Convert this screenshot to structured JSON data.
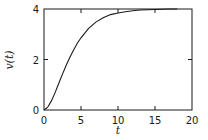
{
  "chart_data": {
    "type": "line",
    "title": "",
    "xlabel": "t",
    "ylabel": "v(t)",
    "xlim": [
      0,
      20
    ],
    "ylim": [
      0,
      4
    ],
    "xticks": [
      0,
      5,
      10,
      15,
      20
    ],
    "yticks": [
      0,
      2,
      4
    ],
    "xtick_labels": [
      "0",
      "5",
      "10",
      "15",
      "20"
    ],
    "ytick_labels": [
      "0",
      "2",
      "4"
    ],
    "grid": false,
    "legend": null,
    "series": [
      {
        "name": "v(t)",
        "x": [
          0,
          0.5,
          1,
          1.5,
          2,
          2.5,
          3,
          3.5,
          4,
          4.5,
          5,
          6,
          7,
          8,
          9,
          10,
          11,
          12,
          13,
          14,
          15,
          16,
          17,
          18
        ],
        "values": [
          0,
          0.11,
          0.36,
          0.69,
          1.06,
          1.42,
          1.77,
          2.09,
          2.38,
          2.64,
          2.86,
          3.22,
          3.48,
          3.65,
          3.78,
          3.84,
          3.89,
          3.93,
          3.96,
          3.97,
          3.98,
          3.99,
          4.0,
          4.0
        ]
      }
    ]
  },
  "axes": {
    "xlabel": "t",
    "ylabel": "v(t)"
  }
}
